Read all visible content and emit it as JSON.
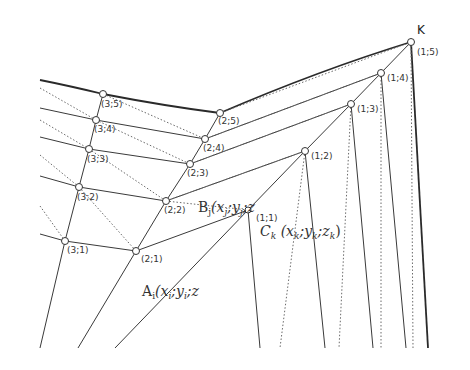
{
  "diagram": {
    "apex_label": "K",
    "nodes": [
      {
        "id": "1;5",
        "label": "(1;5)",
        "x": 411,
        "y": 42
      },
      {
        "id": "1;4",
        "label": "(1;4)",
        "x": 381,
        "y": 73
      },
      {
        "id": "1;3",
        "label": "(1;3)",
        "x": 351,
        "y": 104
      },
      {
        "id": "1;2",
        "label": "(1;2)",
        "x": 305,
        "y": 151
      },
      {
        "id": "1;1",
        "label": "(1;1)",
        "x": 248,
        "y": 210
      },
      {
        "id": "2;5",
        "label": "(2;5)",
        "x": 220,
        "y": 113
      },
      {
        "id": "2;4",
        "label": "(2;4)",
        "x": 205,
        "y": 139
      },
      {
        "id": "2;3",
        "label": "(2;3)",
        "x": 190,
        "y": 164
      },
      {
        "id": "2;2",
        "label": "(2;2)",
        "x": 166,
        "y": 201
      },
      {
        "id": "2;1",
        "label": "(2;1)",
        "x": 136,
        "y": 251
      },
      {
        "id": "3;5",
        "label": "(3;5)",
        "x": 103,
        "y": 94
      },
      {
        "id": "3;4",
        "label": "(3;4)",
        "x": 96,
        "y": 120
      },
      {
        "id": "3;3",
        "label": "(3;3)",
        "x": 89,
        "y": 149
      },
      {
        "id": "3;2",
        "label": "(3;2)",
        "x": 79,
        "y": 187
      },
      {
        "id": "3;1",
        "label": "(3;1)",
        "x": 65,
        "y": 241
      }
    ],
    "point_labels": {
      "B": {
        "main": "B",
        "sub": "j",
        "coords": "(x",
        "coords_sub": "j",
        "rest": ";y",
        "rest_sub": "j",
        "tail": ";z"
      },
      "C": {
        "main": "C",
        "sub": "k",
        "coords": " (x",
        "coords_sub": "k",
        "rest": ";y",
        "rest_sub": "k",
        "tail": ";z",
        "tail_sub": "k",
        "close": ")"
      },
      "A": {
        "main": "A",
        "sub": "i",
        "coords": "(x",
        "coords_sub": "i",
        "rest": ";y",
        "rest_sub": "i",
        "tail": ";z"
      }
    },
    "labels": {
      "n15": "(1;5)",
      "n14": "(1;4)",
      "n13": "(1;3)",
      "n12": "(1;2)",
      "n11": "(1;1)",
      "n25": "(2;5)",
      "n24": "(2;4)",
      "n23": "(2;3)",
      "n22": "(2;2)",
      "n21": "(2;1)",
      "n35": "(3;5)",
      "n34": "(3;4)",
      "n33": "(3;3)",
      "n32": "(3;2)",
      "n31": "(3;1)"
    },
    "colors": {
      "line": "#3a3a3a",
      "dotted": "#6a6a6a",
      "background": "#ffffff"
    }
  }
}
